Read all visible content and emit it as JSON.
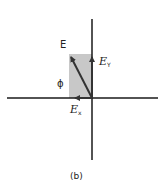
{
  "diagram": {
    "caption": "(b)",
    "labels": {
      "vector": "E",
      "angle": "ϕ",
      "x_component": "E",
      "x_sub": "x",
      "y_component": "E",
      "y_sub": "Y"
    },
    "colors": {
      "axis": "#1a1a1a",
      "vector": "#333333",
      "shade": "#c8c8c8",
      "text": "#222222"
    }
  }
}
